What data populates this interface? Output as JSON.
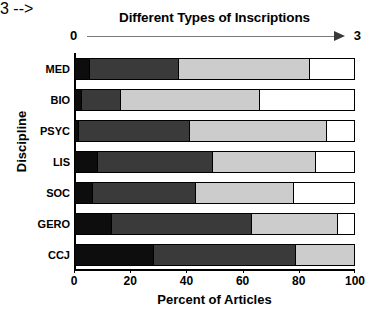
{
  "chart_data": {
    "type": "bar",
    "subtype": "horizontal-stacked-100pct",
    "title": "Different Types of Inscriptions",
    "xlabel": "Percent of Articles",
    "ylabel": "Discipline",
    "xlim": [
      0,
      100
    ],
    "xticks": [
      0,
      20,
      40,
      60,
      80,
      100
    ],
    "xtick_labels": [
      "0",
      "20",
      "40",
      "60",
      "80",
      "100"
    ],
    "grid": false,
    "legend": "none",
    "top_axis": {
      "label_left": "0",
      "label_right": "3",
      "arrow": "right",
      "description": "Different Types of Inscriptions scale from 0 to 3"
    },
    "categories": [
      "MED",
      "BIO",
      "PSYC",
      "LIS",
      "SOC",
      "GERO",
      "CCJ"
    ],
    "series": [
      {
        "name": "0 types",
        "color": "#0d0d0d",
        "values": [
          5,
          2,
          1,
          8,
          6,
          13,
          28
        ]
      },
      {
        "name": "1 type",
        "color": "#3a3a3a",
        "values": [
          32,
          14,
          40,
          41,
          37,
          50,
          51
        ]
      },
      {
        "name": "2 types",
        "color": "#cccccc",
        "values": [
          47,
          50,
          49,
          37,
          35,
          31,
          21
        ]
      },
      {
        "name": "3 types",
        "color": "#ffffff",
        "values": [
          16,
          34,
          10,
          14,
          22,
          6,
          0
        ]
      }
    ],
    "bars": [
      {
        "category": "MED",
        "segments": [
          5,
          32,
          47,
          16
        ]
      },
      {
        "category": "BIO",
        "segments": [
          2,
          14,
          50,
          34
        ]
      },
      {
        "category": "PSYC",
        "segments": [
          1,
          40,
          49,
          10
        ]
      },
      {
        "category": "LIS",
        "segments": [
          8,
          41,
          37,
          14
        ]
      },
      {
        "category": "SOC",
        "segments": [
          6,
          37,
          35,
          22
        ]
      },
      {
        "category": "GERO",
        "segments": [
          13,
          50,
          31,
          6
        ]
      },
      {
        "category": "CCJ",
        "segments": [
          28,
          51,
          21,
          0
        ]
      }
    ],
    "colors": {
      "segment_0": "#0d0d0d",
      "segment_1": "#3a3a3a",
      "segment_2": "#cccccc",
      "segment_3": "#ffffff",
      "axis": "#000000",
      "arrow": "#3a3a3a",
      "background": "#ffffff"
    }
  }
}
